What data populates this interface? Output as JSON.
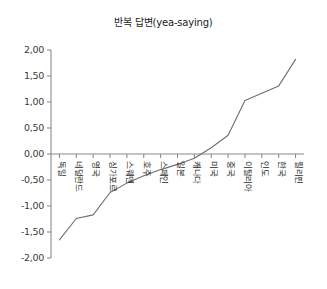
{
  "chart_data": {
    "type": "line",
    "title": "반복 답변(yea-saying)",
    "xlabel": "",
    "ylabel": "",
    "ylim": [
      -2.0,
      2.0
    ],
    "ytick_step": 0.5,
    "grid": false,
    "legend": null,
    "zero_reference_line": true,
    "categories": [
      "독일",
      "네덜란드",
      "영국",
      "싱가포르",
      "스웨덴",
      "호주",
      "스페인",
      "일본",
      "캐나다",
      "미국",
      "중국",
      "이탈리아",
      "인도",
      "한국",
      "필리핀"
    ],
    "values": [
      -1.65,
      -1.24,
      -1.17,
      -0.74,
      -0.56,
      -0.42,
      -0.3,
      -0.2,
      -0.08,
      0.12,
      0.36,
      1.03,
      1.17,
      1.31,
      1.82
    ],
    "ytick_labels": [
      "2,00",
      "1,50",
      "1,00",
      "0,50",
      "0,00",
      "-0,50",
      "-1,00",
      "-1,50",
      "-2,00"
    ],
    "ytick_values": [
      2.0,
      1.5,
      1.0,
      0.5,
      0.0,
      -0.5,
      -1.0,
      -1.5,
      -2.0
    ]
  }
}
